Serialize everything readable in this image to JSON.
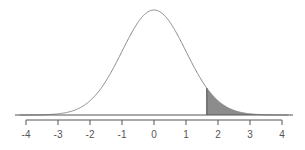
{
  "chart_data": {
    "type": "area",
    "title": "",
    "subtitle": "Standard normal distribution with shaded upper tail",
    "xlabel": "",
    "ylabel": "",
    "xlim": [
      -4,
      4
    ],
    "x_ticks": [
      -4,
      -3,
      -2,
      -1,
      0,
      1,
      2,
      3,
      4
    ],
    "tick_labels": [
      "-4",
      "-3",
      "-2",
      "-1",
      "0",
      "1",
      "2",
      "3",
      "4"
    ],
    "distribution": {
      "name": "normal",
      "mean": 0,
      "sd": 1
    },
    "shaded_region": {
      "from": 1.65,
      "to": 4,
      "tail": "upper"
    },
    "grid": false,
    "legend": null,
    "colors": {
      "curve": "#888888",
      "shade": "#8c8c8c",
      "axis": "#555555",
      "baseline": "#555555"
    }
  }
}
